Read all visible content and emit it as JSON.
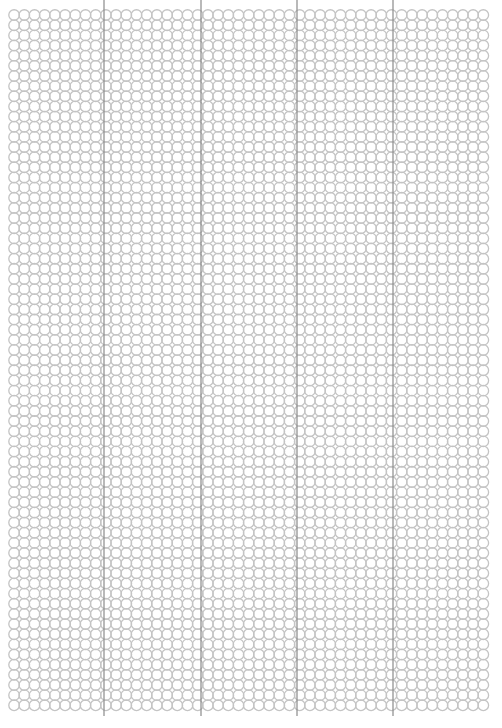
{
  "page": {
    "type": "circle-grid-paper",
    "background": "#ffffff",
    "grid": {
      "left": 9,
      "top": 10,
      "pitch_x": 10.2,
      "pitch_y": 10.15,
      "columns": 47,
      "rows": 69,
      "circle_radius": 5.3,
      "circle_color": "#c4c4c4"
    },
    "vertical_lines": {
      "x": [
        104,
        201,
        297,
        393
      ],
      "top": 0,
      "bottom": 716,
      "color": "#8a8a8a"
    }
  }
}
